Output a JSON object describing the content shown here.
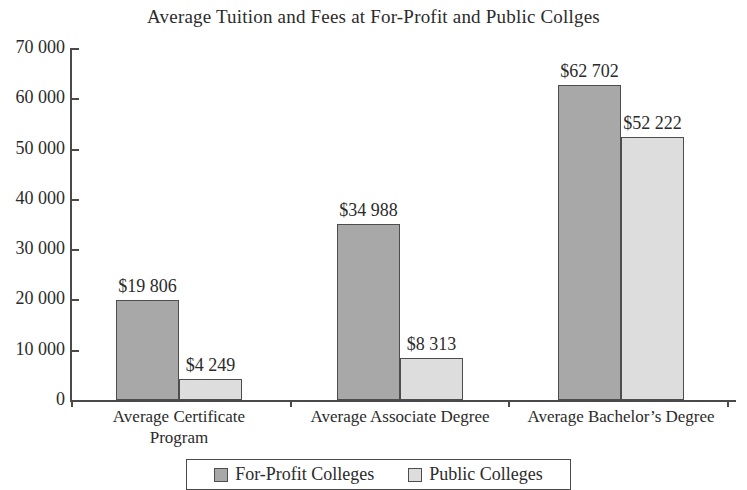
{
  "chart_data": {
    "type": "bar",
    "title": "Average Tuition and Fees at For-Profit and Public Collges",
    "xlabel": "",
    "ylabel": "",
    "ylim": [
      0,
      70000
    ],
    "ytick_labels": [
      "0",
      "10 000",
      "20 000",
      "30 000",
      "40 000",
      "50 000",
      "60 000",
      "70 000"
    ],
    "ytick_values": [
      0,
      10000,
      20000,
      30000,
      40000,
      50000,
      60000,
      70000
    ],
    "grid": false,
    "legend_position": "bottom",
    "categories": [
      "Average Certificate\nProgram",
      "Average Associate Degree",
      "Average Bachelor’s Degree"
    ],
    "series": [
      {
        "name": "For-Profit Colleges",
        "color": "#a8a8a8",
        "values": [
          19806,
          34988,
          62702
        ],
        "value_labels": [
          "$19 806",
          "$34 988",
          "$62 702"
        ]
      },
      {
        "name": "Public Colleges",
        "color": "#dddddd",
        "values": [
          4249,
          8313,
          52222
        ],
        "value_labels": [
          "$4 249",
          "$8 313",
          "$52 222"
        ]
      }
    ]
  },
  "axis": {
    "line_color": "#4a4a4a"
  }
}
